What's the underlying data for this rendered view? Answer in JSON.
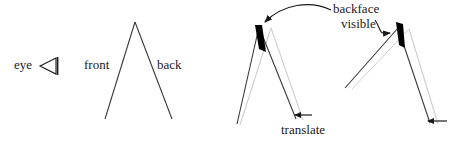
{
  "figure": {
    "background_color": "#ffffff",
    "stroke_color": "#1a1a1a",
    "ghost_color": "#c8c8c8",
    "backface_color": "#000000"
  },
  "labels": {
    "eye": "eye",
    "front": "front",
    "back": "back",
    "backface": "backface",
    "visible": "visible",
    "translate": "translate"
  },
  "icons": {
    "eye_symbol": "eye-frustum-icon",
    "translate_arrow": "left-arrow-icon",
    "callout_arrow": "curved-arrow-icon"
  },
  "panels": [
    {
      "name": "original-silhouette",
      "description": "Unrotated V shape seen by the eye; front face on left, back face on right",
      "apex": [
        135,
        22
      ],
      "left_leg_end": [
        105,
        119
      ],
      "right_leg_end": [
        172,
        119
      ],
      "backface_visible": false
    },
    {
      "name": "translated-silhouette-left",
      "description": "Shape translated left; thin black sliver of the backface becomes visible at the apex",
      "apex": [
        259,
        27
      ],
      "ghost_apex": [
        271,
        28
      ],
      "backface_visible": true,
      "translate_direction": "left"
    },
    {
      "name": "translated-silhouette-right",
      "description": "Rotated shape translated left; backface sliver visible at apex",
      "apex": [
        398,
        28
      ],
      "ghost_apex": [
        409,
        29
      ],
      "backface_visible": true,
      "translate_direction": "left"
    }
  ]
}
